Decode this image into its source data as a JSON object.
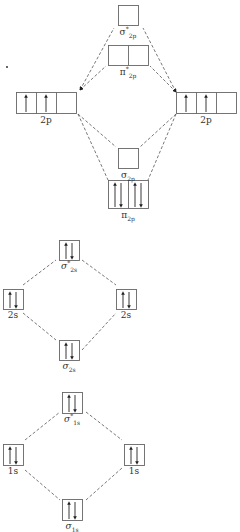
{
  "diagram": {
    "type": "molecular-orbital-energy-level-diagram",
    "colors": {
      "line": "#555555",
      "box": "#666666",
      "arrow": "#222222",
      "text": "#333333",
      "background": "#ffffff"
    },
    "sections": [
      {
        "id": "2p",
        "atomic_left": {
          "label": "2p",
          "x": 16,
          "y": 92,
          "w": 60,
          "h": 21,
          "cells": 3,
          "electrons": [
            "up",
            "up",
            ""
          ]
        },
        "atomic_right": {
          "label": "2p",
          "x": 176,
          "y": 92,
          "w": 60,
          "h": 21,
          "cells": 3,
          "electrons": [
            "up",
            "up",
            ""
          ]
        },
        "molecular": [
          {
            "name": "sigma-star-2p",
            "symbol": "σ",
            "sub": "2p",
            "sup": "*",
            "x": 118,
            "y": 5,
            "w": 20,
            "h": 20,
            "cells": 1,
            "electrons": [
              ""
            ]
          },
          {
            "name": "pi-star-2p",
            "symbol": "π",
            "sub": "2p",
            "sup": "*",
            "x": 108,
            "y": 45,
            "w": 40,
            "h": 20,
            "cells": 2,
            "electrons": [
              "",
              ""
            ]
          },
          {
            "name": "sigma-2p",
            "symbol": "σ",
            "sub": "2p",
            "sup": "",
            "x": 118,
            "y": 148,
            "w": 20,
            "h": 20,
            "cells": 1,
            "electrons": [
              ""
            ]
          },
          {
            "name": "pi-2p",
            "symbol": "π",
            "sub": "2p",
            "sup": "",
            "x": 108,
            "y": 180,
            "w": 40,
            "h": 28,
            "cells": 2,
            "electrons": [
              "pair",
              "pair"
            ]
          }
        ]
      },
      {
        "id": "2s",
        "atomic_left": {
          "label": "2s",
          "x": 3,
          "y": 289,
          "w": 20,
          "h": 20,
          "cells": 1,
          "electrons": [
            "pair"
          ]
        },
        "atomic_right": {
          "label": "2s",
          "x": 116,
          "y": 289,
          "w": 20,
          "h": 20,
          "cells": 1,
          "electrons": [
            "pair"
          ]
        },
        "molecular": [
          {
            "name": "sigma-star-2s",
            "symbol": "σ",
            "sub": "2s",
            "sup": "*",
            "x": 59,
            "y": 240,
            "w": 20,
            "h": 20,
            "cells": 1,
            "electrons": [
              "pair"
            ]
          },
          {
            "name": "sigma-2s",
            "symbol": "σ",
            "sub": "2s",
            "sup": "",
            "x": 59,
            "y": 340,
            "w": 20,
            "h": 20,
            "cells": 1,
            "electrons": [
              "pair"
            ]
          }
        ]
      },
      {
        "id": "1s",
        "atomic_left": {
          "label": "1s",
          "x": 3,
          "y": 444,
          "w": 20,
          "h": 21,
          "cells": 1,
          "electrons": [
            "pair"
          ]
        },
        "atomic_right": {
          "label": "1s",
          "x": 124,
          "y": 444,
          "w": 20,
          "h": 21,
          "cells": 1,
          "electrons": [
            "pair"
          ]
        },
        "molecular": [
          {
            "name": "sigma-star-1s",
            "symbol": "σ",
            "sub": "1s",
            "sup": "*",
            "x": 62,
            "y": 392,
            "w": 20,
            "h": 21,
            "cells": 1,
            "electrons": [
              "pair"
            ]
          },
          {
            "name": "sigma-1s",
            "symbol": "σ",
            "sub": "1s",
            "sup": "",
            "x": 62,
            "y": 499,
            "w": 20,
            "h": 21,
            "cells": 1,
            "electrons": [
              "pair"
            ]
          }
        ]
      }
    ],
    "labels": {
      "sigma_star_2p": {
        "base": "σ",
        "sup": "*",
        "sub": "2p"
      },
      "pi_star_2p": {
        "base": "π",
        "sup": "*",
        "sub": "2p"
      },
      "left_2p": "2p",
      "right_2p": "2p",
      "sigma_2p": {
        "base": "σ",
        "sub": "2p"
      },
      "pi_2p": {
        "base": "π",
        "sub": "2p"
      },
      "sigma_star_2s": {
        "base": "σ",
        "sup": "*",
        "sub": "2s"
      },
      "left_2s": "2s",
      "right_2s": "2s",
      "sigma_2s": {
        "base": "σ",
        "sub": "2s"
      },
      "sigma_star_1s": {
        "base": "σ",
        "sup": "*",
        "sub": "1s"
      },
      "left_1s": "1s",
      "right_1s": "1s",
      "sigma_1s": {
        "base": "σ",
        "sub": "1s"
      }
    },
    "connectors": [
      {
        "from": [
          80,
          90
        ],
        "to": [
          114,
          28
        ],
        "arrow_end": "from"
      },
      {
        "from": [
          80,
          90
        ],
        "to": [
          106,
          66
        ],
        "arrow_end": "from"
      },
      {
        "from": [
          176,
          92
        ],
        "to": [
          143,
          28
        ],
        "arrow_end": "from"
      },
      {
        "from": [
          176,
          92
        ],
        "to": [
          150,
          66
        ],
        "arrow_end": "from"
      },
      {
        "from": [
          78,
          114
        ],
        "to": [
          116,
          147
        ]
      },
      {
        "from": [
          78,
          114
        ],
        "to": [
          108,
          180
        ]
      },
      {
        "from": [
          176,
          114
        ],
        "to": [
          140,
          147
        ]
      },
      {
        "from": [
          176,
          114
        ],
        "to": [
          148,
          180
        ]
      },
      {
        "from": [
          23,
          285
        ],
        "to": [
          56,
          260
        ]
      },
      {
        "from": [
          82,
          260
        ],
        "to": [
          116,
          285
        ]
      },
      {
        "from": [
          23,
          313
        ],
        "to": [
          56,
          340
        ]
      },
      {
        "from": [
          82,
          350
        ],
        "to": [
          116,
          313
        ]
      },
      {
        "from": [
          25,
          440
        ],
        "to": [
          60,
          412
        ]
      },
      {
        "from": [
          86,
          412
        ],
        "to": [
          122,
          440
        ]
      },
      {
        "from": [
          25,
          470
        ],
        "to": [
          60,
          500
        ]
      },
      {
        "from": [
          86,
          500
        ],
        "to": [
          122,
          468
        ]
      }
    ],
    "stray_dot": {
      "x": 7,
      "y": 67
    }
  }
}
